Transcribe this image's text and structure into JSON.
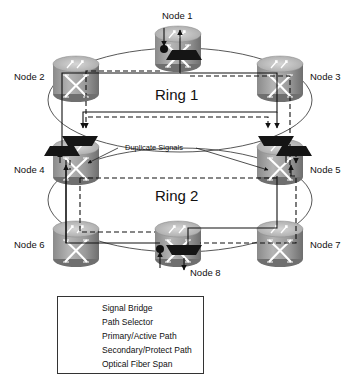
{
  "diagram": {
    "type": "dual-ring optical network with signal bridges and path selectors",
    "nodes": [
      {
        "id": "node1",
        "label": "Node 1",
        "ring": "Ring 1",
        "features": [
          "signal-bridge",
          "path-selector"
        ]
      },
      {
        "id": "node2",
        "label": "Node 2",
        "ring": "Ring 1"
      },
      {
        "id": "node3",
        "label": "Node 3",
        "ring": "Ring 1"
      },
      {
        "id": "node4",
        "label": "Node 4",
        "ring": "Ring 1 / Ring 2",
        "features": [
          "path-selector",
          "path-selector"
        ]
      },
      {
        "id": "node5",
        "label": "Node 5",
        "ring": "Ring 1 / Ring 2",
        "features": [
          "path-selector",
          "path-selector"
        ]
      },
      {
        "id": "node6",
        "label": "Node 6",
        "ring": "Ring 2"
      },
      {
        "id": "node7",
        "label": "Node 7",
        "ring": "Ring 2"
      },
      {
        "id": "node8",
        "label": "Node 8",
        "ring": "Ring 2",
        "features": [
          "signal-bridge",
          "path-selector"
        ]
      }
    ],
    "rings": [
      {
        "id": "ring1",
        "label": "Ring 1",
        "members": [
          "Node 1",
          "Node 2",
          "Node 3",
          "Node 4",
          "Node 5"
        ]
      },
      {
        "id": "ring2",
        "label": "Ring 2",
        "members": [
          "Node 4",
          "Node 5",
          "Node 6",
          "Node 7",
          "Node 8"
        ]
      }
    ],
    "annotations": {
      "duplicate_signals": "Duplicate Signals"
    }
  },
  "legend": {
    "items": [
      {
        "symbol": "signal-bridge",
        "label": "Signal Bridge"
      },
      {
        "symbol": "path-selector",
        "label": "Path Selector"
      },
      {
        "symbol": "primary-path",
        "label": "Primary/Active Path"
      },
      {
        "symbol": "secondary-path",
        "label": "Secondary/Protect Path"
      },
      {
        "symbol": "fiber-span",
        "label": "Optical Fiber Span"
      }
    ]
  },
  "colors": {
    "node_body": "#9a9a9a",
    "node_top": "#c4c4c4",
    "node_front": "#7d7d7d",
    "selector": "#1a1a1a",
    "line": "#111111",
    "fiber": "#444444",
    "background": "#ffffff"
  }
}
